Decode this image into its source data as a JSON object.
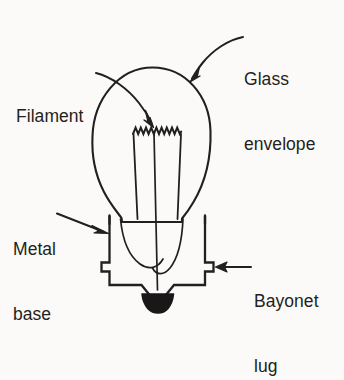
{
  "figure": {
    "background_color": "#fbfaf8",
    "line_color": "#231f20",
    "contact_fill_color": "#1a1718",
    "width": 344,
    "height": 327
  },
  "labels": {
    "glass_envelope": {
      "line1": "Glass",
      "line2": "envelope",
      "pointer": "curved-arrow-down-left"
    },
    "filament": {
      "line1": "Filament",
      "line2": "",
      "pointer": "curved-arrow-down-right"
    },
    "metal_base": {
      "line1": "Metal",
      "line2": "base",
      "pointer": "straight-arrow-right"
    },
    "bayonet_lug": {
      "line1": "Bayonet",
      "line2": "lug",
      "pointer": "straight-arrow-left"
    }
  },
  "parts": [
    {
      "name": "glass-envelope",
      "description": "Pear shaped bulb outline"
    },
    {
      "name": "filament",
      "description": "Zigzag coil at top of shroud"
    },
    {
      "name": "filament-shroud",
      "description": "Trapezoidal inner glass shroud"
    },
    {
      "name": "support-wires",
      "description": "Lead-in wires converging to base"
    },
    {
      "name": "metal-base",
      "description": "Cylindrical metal cap"
    },
    {
      "name": "bayonet-lug-left",
      "description": "Left side locking lug"
    },
    {
      "name": "bayonet-lug-right",
      "description": "Right side locking lug"
    },
    {
      "name": "contact-tip",
      "description": "Solder contact at bottom"
    }
  ]
}
